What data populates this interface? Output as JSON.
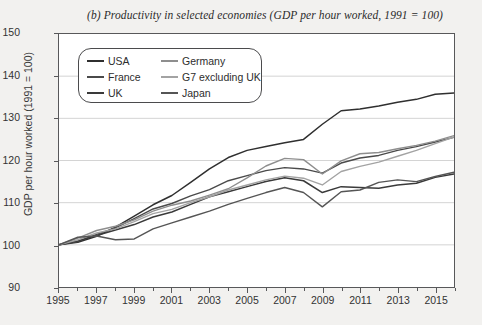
{
  "chart_data": {
    "type": "line",
    "title": "(b) Productivity in selected economies (GDP per hour worked, 1991 = 100)",
    "xlabel": "",
    "ylabel": "GDP per hour worked (1991 = 100)",
    "ylim": [
      90,
      150
    ],
    "yticks": [
      90,
      100,
      110,
      120,
      130,
      140,
      150
    ],
    "xlim": [
      1995,
      2016
    ],
    "xticks": [
      1995,
      1997,
      1999,
      2001,
      2003,
      2005,
      2007,
      2009,
      2011,
      2013,
      2015
    ],
    "minor_xticks_every": 1,
    "grid": "horizontal",
    "legend_position": "upper-left-inside",
    "x": [
      1995,
      1996,
      1997,
      1998,
      1999,
      2000,
      2001,
      2002,
      2003,
      2004,
      2005,
      2006,
      2007,
      2008,
      2009,
      2010,
      2011,
      2012,
      2013,
      2014,
      2015,
      2016
    ],
    "series": [
      {
        "name": "USA",
        "color": "#2f2f2f",
        "width": 1.5,
        "values": [
          100.0,
          100.6,
          102.0,
          104.2,
          106.8,
          109.5,
          111.7,
          114.8,
          118.0,
          120.7,
          122.4,
          123.3,
          124.2,
          125.0,
          128.6,
          131.8,
          132.2,
          132.9,
          133.8,
          134.5,
          135.7,
          136.0
        ]
      },
      {
        "name": "France",
        "color": "#4a4a4a",
        "width": 1.4,
        "values": [
          100.0,
          100.8,
          102.5,
          104.0,
          106.2,
          108.5,
          109.8,
          111.6,
          113.1,
          115.2,
          116.4,
          117.6,
          118.3,
          118.0,
          117.0,
          119.4,
          120.6,
          121.2,
          122.4,
          123.3,
          124.4,
          125.5
        ]
      },
      {
        "name": "UK",
        "color": "#3a3a3a",
        "width": 1.5,
        "values": [
          100.0,
          100.9,
          102.2,
          103.5,
          104.8,
          106.6,
          107.8,
          109.6,
          111.4,
          112.6,
          113.8,
          115.0,
          115.9,
          115.2,
          112.4,
          113.8,
          113.6,
          113.4,
          114.2,
          114.6,
          116.0,
          116.8
        ]
      },
      {
        "name": "Germany",
        "color": "#8e8e8e",
        "width": 1.4,
        "values": [
          100.0,
          101.6,
          103.4,
          104.4,
          105.9,
          108.0,
          109.4,
          110.4,
          111.8,
          113.3,
          115.9,
          118.7,
          120.5,
          120.2,
          116.8,
          119.9,
          121.6,
          121.9,
          122.8,
          123.6,
          124.6,
          125.9
        ]
      },
      {
        "name": "G7 excluding UK",
        "color": "#a3a3a3",
        "width": 1.4,
        "values": [
          100.0,
          101.2,
          102.8,
          103.8,
          105.5,
          107.4,
          108.4,
          110.0,
          111.4,
          113.0,
          114.2,
          115.4,
          116.3,
          115.8,
          114.2,
          117.4,
          118.6,
          119.6,
          121.0,
          122.4,
          124.0,
          125.6
        ]
      },
      {
        "name": "Japan",
        "color": "#555555",
        "width": 1.4,
        "values": [
          100.0,
          101.8,
          102.1,
          101.2,
          101.4,
          103.8,
          105.2,
          106.6,
          108.0,
          109.6,
          111.0,
          112.4,
          113.6,
          112.4,
          109.0,
          112.6,
          113.0,
          114.8,
          115.4,
          115.0,
          116.2,
          117.2
        ]
      }
    ]
  },
  "legend": {
    "entries": [
      {
        "label": "USA"
      },
      {
        "label": "Germany"
      },
      {
        "label": "France"
      },
      {
        "label": "G7 excluding UK"
      },
      {
        "label": "UK"
      },
      {
        "label": "Japan"
      }
    ]
  }
}
